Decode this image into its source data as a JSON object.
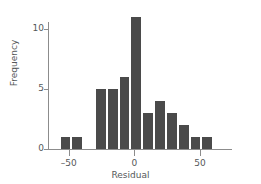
{
  "chart_data": {
    "type": "bar",
    "title": "",
    "xlabel": "Residual",
    "ylabel": "Frequency",
    "xlim": [
      -62,
      69
    ],
    "ylim": [
      0,
      11.6
    ],
    "grid": false,
    "legend": null,
    "bar_color": "#4a4a4a",
    "axis_color": "#8c8c8c",
    "text_color": "#55585a",
    "bin_width": 9,
    "xticks": [
      -50,
      0,
      50
    ],
    "xtick_labels": [
      "–50",
      "0",
      "50"
    ],
    "yticks": [
      0,
      5,
      10
    ],
    "ytick_labels": [
      "0",
      "5",
      "10"
    ],
    "bins": [
      {
        "left": -57,
        "right": -48,
        "center": -52.5,
        "value": 1
      },
      {
        "left": -48,
        "right": -39,
        "center": -43.5,
        "value": 1
      },
      {
        "left": -39,
        "right": -30,
        "center": -34.5,
        "value": 0
      },
      {
        "left": -30,
        "right": -21,
        "center": -25.5,
        "value": 5
      },
      {
        "left": -21,
        "right": -12,
        "center": -16.5,
        "value": 5
      },
      {
        "left": -12,
        "right": -3,
        "center": -7.5,
        "value": 6
      },
      {
        "left": -3,
        "right": 6,
        "center": 1.5,
        "value": 11
      },
      {
        "left": 6,
        "right": 15,
        "center": 10.5,
        "value": 3
      },
      {
        "left": 15,
        "right": 24,
        "center": 19.5,
        "value": 4
      },
      {
        "left": 24,
        "right": 33,
        "center": 28.5,
        "value": 3
      },
      {
        "left": 33,
        "right": 42,
        "center": 37.5,
        "value": 2
      },
      {
        "left": 42,
        "right": 51,
        "center": 46.5,
        "value": 1
      },
      {
        "left": 51,
        "right": 60,
        "center": 55.5,
        "value": 1
      }
    ],
    "values": [
      1,
      1,
      0,
      5,
      5,
      6,
      11,
      3,
      4,
      3,
      2,
      1,
      1
    ],
    "categories": [
      "-57..-48",
      "-48..-39",
      "-39..-30",
      "-30..-21",
      "-21..-12",
      "-12..-3",
      "-3..6",
      "6..15",
      "15..24",
      "24..33",
      "33..42",
      "42..51",
      "51..60"
    ],
    "total_count": 39
  }
}
